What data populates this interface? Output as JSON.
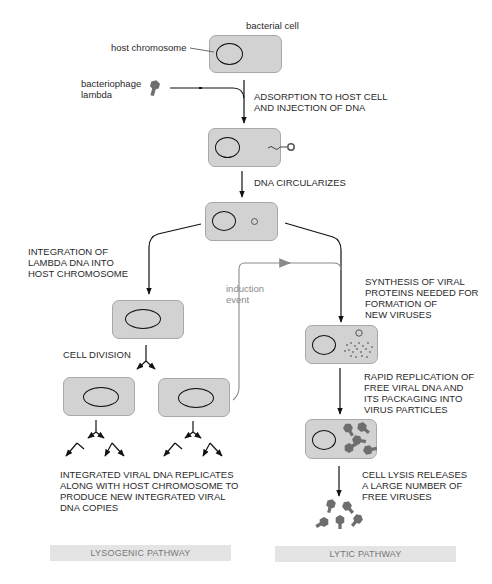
{
  "labels": {
    "bacterial_cell": "bacterial cell",
    "host_chromosome": "host chromosome",
    "bacteriophage": "bacteriophage\nlambda",
    "adsorption": "ADSORPTION TO HOST CELL\nAND INJECTION OF DNA",
    "circularizes": "DNA CIRCULARIZES",
    "integration": "INTEGRATION OF\nLAMBDA DNA INTO\nHOST CHROMOSOME",
    "induction": "induction\nevent",
    "synthesis": "SYNTHESIS OF VIRAL\nPROTEINS NEEDED FOR\nFORMATION OF\nNEW VIRUSES",
    "cell_division": "CELL DIVISION",
    "rapid_replication": "RAPID REPLICATION OF\nFREE VIRAL DNA AND\nITS PACKAGING INTO\nVIRUS PARTICLES",
    "integrated_replicates": "INTEGRATED VIRAL DNA REPLICATES\nALONG WITH HOST CHROMOSOME TO\nPRODUCE NEW INTEGRATED VIRAL\nDNA COPIES",
    "cell_lysis": "CELL LYSIS RELEASES\nA LARGE NUMBER OF\nFREE VIRUSES"
  },
  "pathways": {
    "lysogenic": "LYSOGENIC PATHWAY",
    "lytic": "LYTIC PATHWAY"
  },
  "colors": {
    "cell_fill": "#d2d2d2",
    "virus": "#6e6e6e",
    "band": "#e4e4e4",
    "induction_line": "#8a8a8a"
  }
}
